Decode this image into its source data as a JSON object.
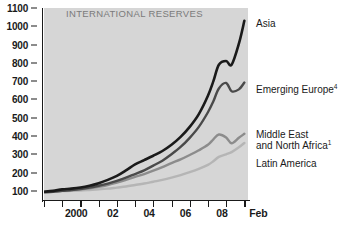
{
  "chart_data": {
    "type": "line",
    "title": "INTERNATIONAL RESERVES",
    "xlabel": "",
    "ylabel": "",
    "ylim": [
      50,
      1100
    ],
    "xlim": [
      1999.0,
      2010.2
    ],
    "yticks": [
      100,
      200,
      300,
      400,
      500,
      600,
      700,
      800,
      900,
      1000,
      1100
    ],
    "ytick_labels": [
      "100",
      "200",
      "300",
      "400",
      "500",
      "600",
      "700",
      "800",
      "900",
      "1000",
      "1100"
    ],
    "xticks": [
      1999.0,
      2000.0,
      2001.0,
      2002.0,
      2003.0,
      2004.0,
      2005.0,
      2006.0,
      2007.0,
      2008.0,
      2009.0,
      2010.0
    ],
    "xtick_labels": [
      "",
      "2000",
      "",
      "02",
      "",
      "04",
      "",
      "06",
      "",
      "08",
      "",
      "Feb"
    ],
    "grid": false,
    "legend_position": "right-of-plot-inline",
    "plot_background": "#d6d6d6",
    "x": [
      1999.0,
      1999.5,
      2000.0,
      2000.5,
      2001.0,
      2001.5,
      2002.0,
      2002.5,
      2003.0,
      2003.5,
      2004.0,
      2004.5,
      2005.0,
      2005.5,
      2006.0,
      2006.5,
      2007.0,
      2007.5,
      2008.0,
      2008.3,
      2008.6,
      2009.0,
      2009.3,
      2009.7,
      2010.0
    ],
    "series": [
      {
        "name": "Asia",
        "label": "Asia",
        "color": "#1a1a1a",
        "width": 2.6,
        "values": [
          95,
          100,
          108,
          112,
          118,
          128,
          142,
          160,
          182,
          212,
          245,
          268,
          292,
          318,
          352,
          395,
          450,
          520,
          620,
          700,
          790,
          810,
          790,
          905,
          1030
        ]
      },
      {
        "name": "Emerging Europe",
        "label": "Emerging Europe",
        "superscript": "4",
        "color": "#4a4a4a",
        "width": 2.4,
        "values": [
          92,
          95,
          100,
          104,
          110,
          118,
          128,
          140,
          155,
          172,
          192,
          212,
          238,
          265,
          300,
          340,
          390,
          450,
          530,
          590,
          660,
          690,
          645,
          655,
          692
        ]
      },
      {
        "name": "Middle East and North Africa",
        "label": "Middle East",
        "label_line2": "and North Africa",
        "superscript": "1",
        "color": "#8c8c8c",
        "width": 2.4,
        "values": [
          94,
          97,
          100,
          103,
          108,
          114,
          122,
          132,
          145,
          160,
          176,
          192,
          210,
          230,
          252,
          272,
          296,
          322,
          352,
          382,
          408,
          392,
          360,
          390,
          412
        ]
      },
      {
        "name": "Latin America",
        "label": "Latin America",
        "color": "#b5b5b5",
        "width": 2.4,
        "values": [
          96,
          97,
          99,
          100,
          102,
          105,
          108,
          112,
          118,
          124,
          132,
          140,
          150,
          160,
          172,
          186,
          202,
          220,
          242,
          262,
          286,
          300,
          312,
          338,
          362
        ]
      }
    ]
  },
  "labels": {
    "asia": "Asia",
    "emerging_europe": "Emerging Europe",
    "emerging_europe_sup": "4",
    "mena_line1": "Middle East",
    "mena_line2": "and North Africa",
    "mena_sup": "1",
    "latin_america": "Latin America"
  }
}
